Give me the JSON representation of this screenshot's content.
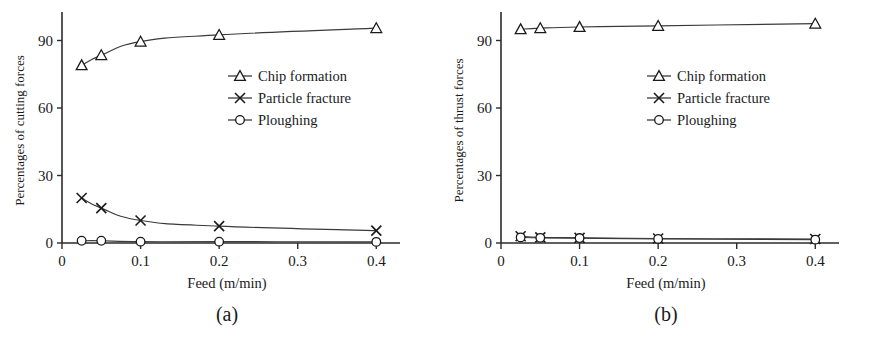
{
  "figure": {
    "panel_count": 2
  },
  "panel_a": {
    "caption": "(a)",
    "chart_data": {
      "type": "line",
      "title": "",
      "subtitle": "",
      "xlabel": "Feed (m/min)",
      "ylabel": "Percentages of cutting forces",
      "x": [
        0.025,
        0.05,
        0.1,
        0.2,
        0.4
      ],
      "xlim": [
        0,
        0.42
      ],
      "ylim": [
        0,
        100
      ],
      "xticks": [
        0,
        0.1,
        0.2,
        0.3,
        0.4
      ],
      "xtick_labels": [
        "0",
        "0.1",
        "0.2",
        "0.3",
        "0.4"
      ],
      "yticks": [
        0,
        30,
        60,
        90
      ],
      "ytick_labels": [
        "0",
        "30",
        "60",
        "90"
      ],
      "grid": false,
      "legend_position": "center-right",
      "series": [
        {
          "name": "Chip formation",
          "marker": "triangle",
          "values": [
            79,
            83.5,
            89.5,
            92.5,
            95.5
          ]
        },
        {
          "name": "Particle fracture",
          "marker": "cross",
          "values": [
            20,
            15.5,
            10,
            7.5,
            5.5
          ]
        },
        {
          "name": "Ploughing",
          "marker": "circle",
          "values": [
            1,
            1,
            0.6,
            0.6,
            0.5
          ]
        }
      ]
    }
  },
  "panel_b": {
    "caption": "(b)",
    "chart_data": {
      "type": "line",
      "title": "",
      "subtitle": "",
      "xlabel": "Feed (m/min)",
      "ylabel": "Percentages of thrust forces",
      "x": [
        0.025,
        0.05,
        0.1,
        0.2,
        0.4
      ],
      "xlim": [
        0,
        0.42
      ],
      "ylim": [
        0,
        100
      ],
      "xticks": [
        0,
        0.1,
        0.2,
        0.3,
        0.4
      ],
      "xtick_labels": [
        "0",
        "0.1",
        "0.2",
        "0.3",
        "0.4"
      ],
      "yticks": [
        0,
        30,
        60,
        90
      ],
      "ytick_labels": [
        "0",
        "30",
        "60",
        "90"
      ],
      "grid": false,
      "legend_position": "center-right",
      "series": [
        {
          "name": "Chip formation",
          "marker": "triangle",
          "values": [
            95,
            95.5,
            96,
            96.5,
            97.5
          ]
        },
        {
          "name": "Particle fracture",
          "marker": "cross",
          "values": [
            3,
            2.5,
            2.3,
            2,
            1.8
          ]
        },
        {
          "name": "Ploughing",
          "marker": "circle",
          "values": [
            2.5,
            2.3,
            2.2,
            1.8,
            1.5
          ]
        }
      ]
    }
  },
  "colors": {
    "line": "#3a3a3a",
    "axis": "#2b2b2b",
    "text": "#1a1a1a",
    "marker_fill": "#ffffff"
  }
}
